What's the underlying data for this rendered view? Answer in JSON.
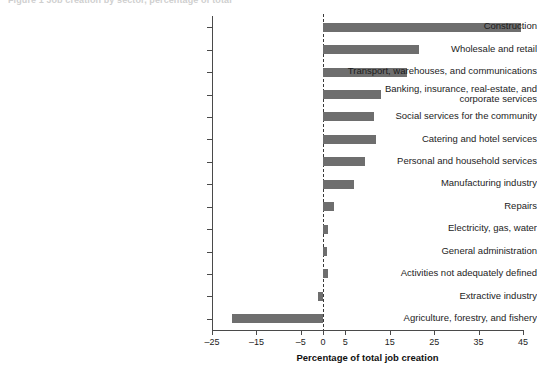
{
  "figure": {
    "title_fragment": "Figure 1  Job creation by sector, percentage of total",
    "xaxis_title": "Percentage of total job creation"
  },
  "chart_data": {
    "type": "bar",
    "orientation": "horizontal",
    "title": "",
    "xlabel": "Percentage of total job creation",
    "ylabel": "",
    "xlim": [
      -25,
      45
    ],
    "xticks": [
      -25,
      -15,
      -5,
      0,
      5,
      15,
      25,
      35,
      45
    ],
    "xtick_labels": [
      "-25",
      "-15",
      "-5",
      "0",
      "5",
      "15",
      "25",
      "35",
      "45"
    ],
    "grid": false,
    "legend": "none",
    "zero_reference_line": true,
    "bar_color": "#6e6e6e",
    "categories": [
      "Construction",
      "Wholesale and retail",
      "Transport, warehouses, and communications",
      "Banking, insurance, real-estate, and\ncorporate services",
      "Social services for the community",
      "Catering and hotel services",
      "Personal and household services",
      "Manufacturing industry",
      "Repairs",
      "Electricity, gas, water",
      "General administration",
      "Activities not adequately defined",
      "Extractive industry",
      "Agriculture, forestry, and fishery"
    ],
    "values": [
      44.5,
      21.5,
      19.0,
      13.0,
      11.5,
      12.0,
      9.5,
      7.0,
      2.5,
      1.0,
      0.8,
      1.2,
      -1.2,
      -20.5
    ]
  }
}
